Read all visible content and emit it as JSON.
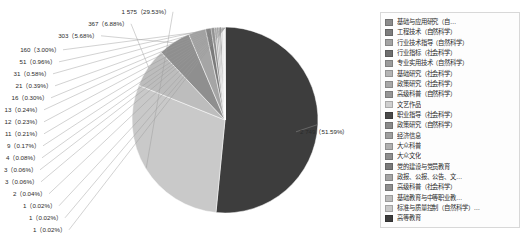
{
  "chart_data": {
    "type": "pie",
    "title": "",
    "subtitle": "",
    "xlabel": "",
    "ylabel": "",
    "legend_position": "right",
    "grid": false,
    "total": 5329,
    "categories": [
      "基础与应用研究（自…",
      "工程技术（自然科学）",
      "行业技术指导（自然科学）",
      "行业指标（社会科学）",
      "专业实用技术（自然科学）",
      "基础研究（社会科学）",
      "政策研究（社会科学）",
      "高级科普（自然科学）",
      "文艺作品",
      "职业指导（社会科学）",
      "政策研究（自然科学）",
      "经济信息",
      "大众科普",
      "大众文化",
      "党的建设与党员教育",
      "政报、公报、公告、文…",
      "高级科普（社会科学）",
      "基础教育与中等职业教…",
      "标准与质量控制（自然科学）…",
      "高等教育"
    ],
    "values": [
      1,
      1,
      1,
      2,
      3,
      3,
      4,
      9,
      11,
      12,
      13,
      16,
      21,
      31,
      51,
      160,
      303,
      367,
      1575,
      2749
    ],
    "percents": [
      "0.02%",
      "0.02%",
      "0.02%",
      "0.04%",
      "0.06%",
      "0.06%",
      "0.08%",
      "0.17%",
      "0.21%",
      "0.23%",
      "0.24%",
      "0.30%",
      "0.39%",
      "0.58%",
      "0.96%",
      "3.00%",
      "5.68%",
      "6.88%",
      "29.53%",
      "51.59%"
    ],
    "data_labels": [
      "1（0.02%）",
      "1（0.02%）",
      "1（0.02%）",
      "2（0.04%）",
      "3（0.06%）",
      "3（0.06%）",
      "4（0.08%）",
      "9（0.17%）",
      "11（0.21%）",
      "12（0.23%）",
      "13（0.24%）",
      "16（0.30%）",
      "21（0.39%）",
      "31（0.58%）",
      "51（0.96%）",
      "160（3.00%）",
      "303（5.68%）",
      "367（6.88%）",
      "1 575（29.53%）",
      "2 749（51.59%）"
    ],
    "colors": [
      "#8c8c8c",
      "#7d7d7d",
      "#a3a3a3",
      "#6e6e6e",
      "#9b9b9b",
      "#b4b4b4",
      "#a8a8a8",
      "#969696",
      "#cfcfcf",
      "#4a4a4a",
      "#8a8a8a",
      "#9f9f9f",
      "#b0b0b0",
      "#8e8e8e",
      "#7a7a7a",
      "#a5a5a5",
      "#8f8f8f",
      "#bdbdbd",
      "#c9c9c9",
      "#3d3d3d"
    ]
  },
  "legend": {
    "items": [
      {
        "label": "基础与应用研究（自…",
        "color": "#8c8c8c"
      },
      {
        "label": "工程技术（自然科学）",
        "color": "#7d7d7d"
      },
      {
        "label": "行业技术指导（自然科学）",
        "color": "#a3a3a3"
      },
      {
        "label": "行业指标（社会科学）",
        "color": "#6e6e6e"
      },
      {
        "label": "专业实用技术（自然科学）",
        "color": "#9b9b9b"
      },
      {
        "label": "基础研究（社会科学）",
        "color": "#b4b4b4"
      },
      {
        "label": "政策研究（社会科学）",
        "color": "#a8a8a8"
      },
      {
        "label": "高级科普（自然科学）",
        "color": "#969696"
      },
      {
        "label": "文艺作品",
        "color": "#cfcfcf"
      },
      {
        "label": "职业指导（社会科学）",
        "color": "#4a4a4a"
      },
      {
        "label": "政策研究（自然科学）",
        "color": "#8a8a8a"
      },
      {
        "label": "经济信息",
        "color": "#9f9f9f"
      },
      {
        "label": "大众科普",
        "color": "#b0b0b0"
      },
      {
        "label": "大众文化",
        "color": "#8e8e8e"
      },
      {
        "label": "党的建设与党员教育",
        "color": "#7a7a7a"
      },
      {
        "label": "政报、公报、公告、文…",
        "color": "#a5a5a5"
      },
      {
        "label": "高级科普（社会科学）",
        "color": "#8f8f8f"
      },
      {
        "label": "基础教育与中等职业教…",
        "color": "#bdbdbd"
      },
      {
        "label": "标准与质量控制（自然科学）…",
        "color": "#c9c9c9"
      },
      {
        "label": "高等教育",
        "color": "#3d3d3d"
      }
    ]
  }
}
